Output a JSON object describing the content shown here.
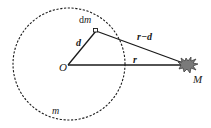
{
  "diagram": {
    "colors": {
      "line": "#1a1a1a",
      "mass_fill": "#7a7a7a",
      "mass_stroke": "#333333",
      "background": "#ffffff"
    },
    "nodes": [
      {
        "id": "O",
        "label": "O",
        "role": "center of body m"
      },
      {
        "id": "dm",
        "label": "dm",
        "role": "mass element"
      },
      {
        "id": "M",
        "label": "M",
        "role": "external point mass"
      }
    ],
    "edges": [
      {
        "from": "O",
        "to": "dm",
        "label": "d",
        "vector": true
      },
      {
        "from": "dm",
        "to": "M",
        "label": "r−d",
        "vector": true
      },
      {
        "from": "O",
        "to": "M",
        "label": "r",
        "vector": true
      }
    ],
    "regions": [
      {
        "id": "body",
        "label": "m",
        "shape": "dashed circle"
      }
    ],
    "labels": {
      "dm_d": "d",
      "dm_m": "m",
      "O": "O",
      "M": "M",
      "d": "d",
      "r_minus_d": "r−d",
      "r": "r",
      "m": "m"
    }
  }
}
